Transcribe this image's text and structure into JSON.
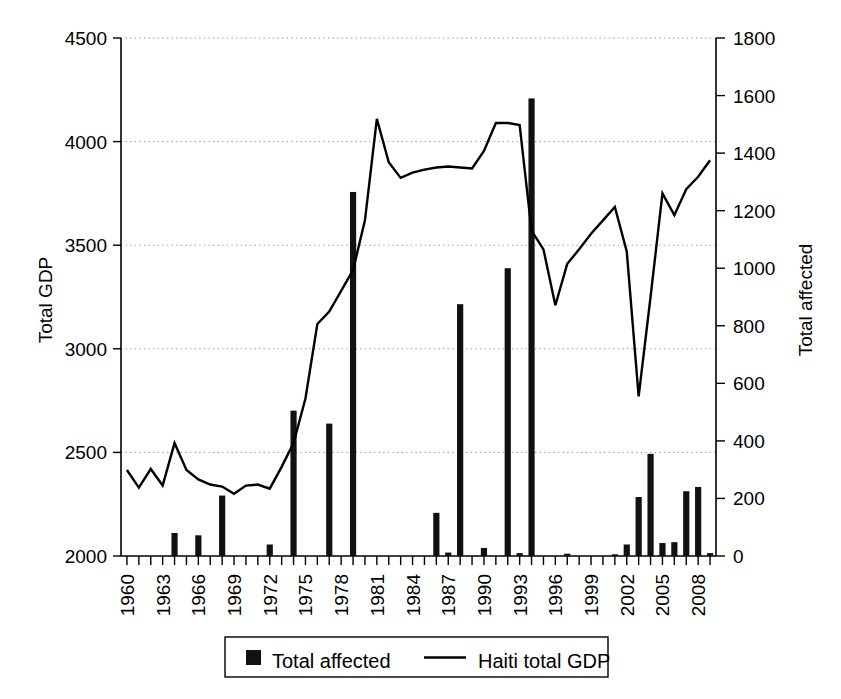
{
  "chart_data": {
    "type": "bar",
    "title": "",
    "xlabel": "",
    "ylabel": "Total GDP",
    "y2label": "Total affected",
    "ylim": [
      2000,
      4500
    ],
    "y2lim": [
      0,
      1800
    ],
    "xlim": [
      1960,
      2009
    ],
    "grid": true,
    "legend_position": "bottom",
    "y_ticks": [
      "2000",
      "2500",
      "3000",
      "3500",
      "4000",
      "4500"
    ],
    "y2_ticks": [
      "0",
      "200",
      "400",
      "600",
      "800",
      "1000",
      "1200",
      "1400",
      "1600",
      "1800"
    ],
    "x_tick_labels": [
      "1960",
      "1963",
      "1966",
      "1969",
      "1972",
      "1975",
      "1978",
      "1981",
      "1984",
      "1987",
      "1990",
      "1993",
      "1996",
      "1999",
      "2002",
      "2005",
      "2008"
    ],
    "x_years": [
      1960,
      1961,
      1962,
      1963,
      1964,
      1965,
      1966,
      1967,
      1968,
      1969,
      1970,
      1971,
      1972,
      1973,
      1974,
      1975,
      1976,
      1977,
      1978,
      1979,
      1980,
      1981,
      1982,
      1983,
      1984,
      1985,
      1986,
      1987,
      1988,
      1989,
      1990,
      1991,
      1992,
      1993,
      1994,
      1995,
      1996,
      1997,
      1998,
      1999,
      2000,
      2001,
      2002,
      2003,
      2004,
      2005,
      2006,
      2007,
      2008,
      2009
    ],
    "series": [
      {
        "name": "Total affected",
        "type": "bar",
        "axis": "right",
        "color": "#111111",
        "values": [
          0,
          0,
          0,
          0,
          80,
          0,
          72,
          0,
          210,
          0,
          0,
          0,
          40,
          0,
          505,
          0,
          0,
          460,
          0,
          1265,
          0,
          0,
          0,
          0,
          0,
          0,
          150,
          12,
          875,
          0,
          28,
          0,
          1000,
          10,
          1590,
          0,
          0,
          8,
          0,
          0,
          0,
          6,
          40,
          205,
          355,
          45,
          48,
          225,
          240,
          10
        ]
      },
      {
        "name": "Haiti total GDP",
        "type": "line",
        "axis": "left",
        "color": "#000000",
        "values": [
          2415,
          2330,
          2420,
          2340,
          2545,
          2415,
          2370,
          2345,
          2335,
          2300,
          2340,
          2345,
          2325,
          2430,
          2545,
          2760,
          3120,
          3180,
          3280,
          3380,
          3620,
          4110,
          3900,
          3825,
          3850,
          3865,
          3875,
          3880,
          3875,
          3870,
          3955,
          4090,
          4090,
          4080,
          3570,
          3480,
          3210,
          3410,
          3480,
          3555,
          3620,
          3685,
          3470,
          2770,
          3250,
          3750,
          3645,
          3770,
          3830,
          3910
        ]
      }
    ],
    "legend": [
      {
        "label": "Total affected",
        "marker": "square"
      },
      {
        "label": "Haiti total GDP",
        "marker": "line"
      }
    ]
  }
}
